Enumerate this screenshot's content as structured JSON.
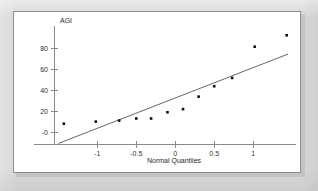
{
  "page": {
    "background_color": "#d8d8d8",
    "plot_background_color": "#ffffff",
    "plot_border_color": "#8d8d8d"
  },
  "chart_data": {
    "type": "scatter",
    "title": "",
    "subtitle": "",
    "xlabel": "Normal Quantiles",
    "ylabel": "AGI",
    "xlim": [
      -1.55,
      1.55
    ],
    "ylim": [
      -12,
      100
    ],
    "grid": false,
    "legend": null,
    "xticks": [
      -1,
      -0.5,
      0,
      0.5,
      1
    ],
    "xtick_labels": [
      "-1",
      "-0.5",
      "0",
      "0.5",
      "1"
    ],
    "yticks": [
      0,
      20,
      40,
      60,
      80
    ],
    "ytick_labels": [
      "-0",
      "20",
      "40",
      "60",
      "80"
    ],
    "series": [
      {
        "name": "AGI",
        "marker": "filled-square",
        "marker_color": "#101010",
        "x": [
          -1.43,
          -1.02,
          -0.72,
          -0.5,
          -0.31,
          -0.1,
          0.1,
          0.3,
          0.5,
          0.73,
          1.02,
          1.43
        ],
        "y": [
          8,
          10,
          11,
          13,
          13,
          19,
          22,
          34,
          44,
          52,
          82,
          93
        ]
      }
    ],
    "reference_line": {
      "name": "normal-reference-line",
      "color": "#55555a",
      "x": [
        -1.5,
        1.45
      ],
      "y": [
        -11,
        75
      ]
    }
  },
  "axes": {
    "y_axis_label": "AGI",
    "x_axis_label": "Normal Quantiles"
  }
}
